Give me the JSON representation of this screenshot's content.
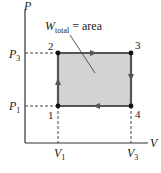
{
  "diagram": {
    "type": "pv-diagram",
    "axes": {
      "y_label": "P",
      "x_label": "V",
      "y_ticks": [
        {
          "label": "P",
          "sub": "3"
        },
        {
          "label": "P",
          "sub": "1"
        }
      ],
      "x_ticks": [
        {
          "label": "V",
          "sub": "1"
        },
        {
          "label": "V",
          "sub": "3"
        }
      ]
    },
    "points": [
      {
        "id": "1",
        "label": "1"
      },
      {
        "id": "2",
        "label": "2"
      },
      {
        "id": "3",
        "label": "3"
      },
      {
        "id": "4",
        "label": "4"
      }
    ],
    "annotation": {
      "main": "W",
      "sub": "total",
      "rest": " = area"
    },
    "cycle": [
      "1→2",
      "2→3",
      "3→4",
      "4→1"
    ],
    "colors": {
      "fill": "#d3d3d3",
      "stroke": "#555555",
      "axis": "#333333",
      "point": "#111111"
    }
  }
}
